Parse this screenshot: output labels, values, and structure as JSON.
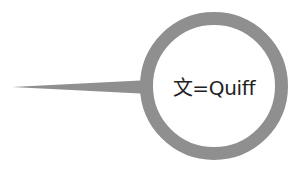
{
  "diagram": {
    "type": "speech-bubble",
    "label": "文=Quiff",
    "colors": {
      "ring": "#8f8f8f",
      "fill": "#ffffff",
      "text": "#222222"
    }
  }
}
